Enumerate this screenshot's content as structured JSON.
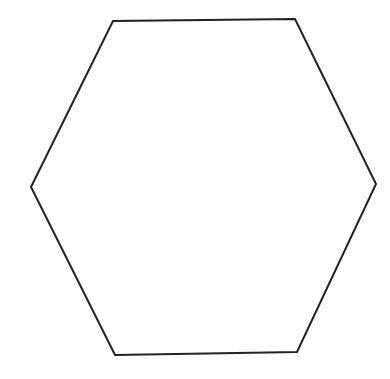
{
  "diagram": {
    "shape": "hexagon",
    "fill": "#ffffff",
    "stroke": "#222222",
    "stroke_width": 2,
    "points": [
      [
        113,
        21
      ],
      [
        295,
        19
      ],
      [
        376,
        184
      ],
      [
        297,
        352
      ],
      [
        115,
        355
      ],
      [
        31,
        187
      ]
    ]
  }
}
